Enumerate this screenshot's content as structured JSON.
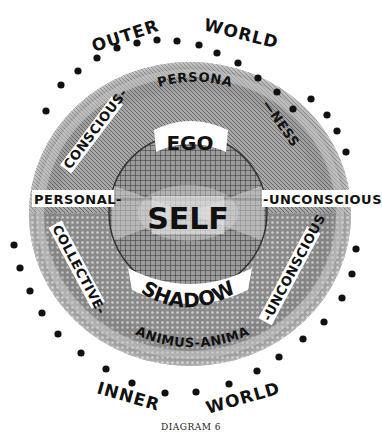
{
  "diagram": {
    "outer_labels": {
      "top_left": "OUTER",
      "top_right": "WORLD",
      "bottom_left": "INNER",
      "bottom_right": "WORLD"
    },
    "ring_labels": {
      "persona": "PERSONA",
      "conscious": "CONSCIOUS-",
      "ness": "—NESS",
      "personal": "PERSONAL-",
      "unconscious_right": "-UNCONSCIOUS",
      "collective": "COLLECTIVE-",
      "unconscious_lower": "-UNCONSCIOUS",
      "animus_anima": "ANIMUS-ANIMA"
    },
    "center_labels": {
      "ego": "EGO",
      "self": "SELF",
      "shadow": "SHADOW"
    },
    "caption": "DIAGRAM 6",
    "colors": {
      "ink": "#111111",
      "disc_outer": "#9a9a9a",
      "disc_inner": "#6e6e6e",
      "self_circle": "#b5b5b5",
      "paper": "#ffffff"
    },
    "dots": [
      [
        46,
        111
      ],
      [
        61,
        85
      ],
      [
        78,
        71
      ],
      [
        97,
        58
      ],
      [
        117,
        48
      ],
      [
        137,
        43
      ],
      [
        157,
        40
      ],
      [
        177,
        41
      ],
      [
        199,
        45
      ],
      [
        217,
        53
      ],
      [
        238,
        63
      ],
      [
        258,
        78
      ],
      [
        277,
        92
      ],
      [
        293,
        109
      ],
      [
        311,
        99
      ],
      [
        327,
        115
      ],
      [
        337,
        131
      ],
      [
        346,
        152
      ],
      [
        14,
        245
      ],
      [
        20,
        268
      ],
      [
        30,
        291
      ],
      [
        42,
        313
      ],
      [
        58,
        334
      ],
      [
        81,
        353
      ],
      [
        106,
        369
      ],
      [
        132,
        383
      ],
      [
        165,
        393
      ],
      [
        196,
        392
      ],
      [
        229,
        384
      ],
      [
        257,
        371
      ],
      [
        279,
        357
      ],
      [
        303,
        339
      ],
      [
        324,
        322
      ],
      [
        342,
        298
      ],
      [
        352,
        274
      ],
      [
        356,
        249
      ]
    ]
  }
}
